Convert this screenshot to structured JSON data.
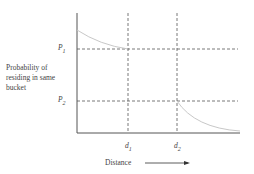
{
  "diagram": {
    "y_axis_label": [
      "Probability of",
      "residing in same",
      "bucket"
    ],
    "x_axis_label": "Distance",
    "levels": {
      "p1": {
        "label": "P",
        "sub": "1"
      },
      "p2": {
        "label": "P",
        "sub": "2"
      }
    },
    "thresholds": {
      "d1": {
        "label": "d",
        "sub": "1"
      },
      "d2": {
        "label": "d",
        "sub": "2"
      }
    },
    "colors": {
      "axis": "#555555",
      "dashed": "#555555",
      "curve": "#c8c8c8"
    }
  }
}
